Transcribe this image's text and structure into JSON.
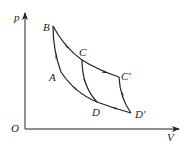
{
  "diagram": {
    "type": "p-V cycle diagram",
    "axes": {
      "y_label": "p",
      "x_label": "V",
      "origin_label": "O"
    },
    "points": {
      "B": "B",
      "C": "C",
      "C_prime": "C'",
      "A": "A",
      "D": "D",
      "D_prime": "D'"
    },
    "paths": [
      {
        "from": "B",
        "to": "C",
        "shape": "curve",
        "arrow": "toward C"
      },
      {
        "from": "C",
        "to": "C'",
        "shape": "curve",
        "arrow": "toward C'"
      },
      {
        "from": "C'",
        "to": "D'",
        "shape": "curve",
        "arrow": "toward D'"
      },
      {
        "from": "D'",
        "to": "D",
        "shape": "curve",
        "arrow": "toward D"
      },
      {
        "from": "D",
        "to": "A",
        "shape": "curve",
        "arrow": "toward A"
      },
      {
        "from": "A",
        "to": "B",
        "shape": "curve",
        "arrow": "toward B"
      },
      {
        "from": "C",
        "to": "D",
        "shape": "curve",
        "arrow": "toward D"
      }
    ]
  }
}
